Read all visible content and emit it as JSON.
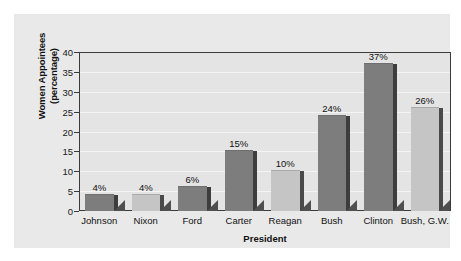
{
  "chart_data": {
    "type": "bar",
    "title": "",
    "subtitle": "",
    "xlabel": "President",
    "ylabel": "Women Appointees (percentage)",
    "ylabel_line1": "Women Appointees",
    "ylabel_line2": "(percentage)",
    "categories": [
      "Johnson",
      "Nixon",
      "Ford",
      "Carter",
      "Reagan",
      "Bush",
      "Clinton",
      "Bush, G.W."
    ],
    "values": [
      4,
      4,
      6,
      15,
      10,
      24,
      37,
      26
    ],
    "value_labels": [
      "4%",
      "4%",
      "6%",
      "15%",
      "10%",
      "24%",
      "37%",
      "26%"
    ],
    "ylim": [
      0,
      40
    ],
    "yticks": [
      0,
      5,
      10,
      15,
      20,
      25,
      30,
      35,
      40
    ],
    "ytick_labels": [
      "0",
      "5",
      "10",
      "15",
      "20",
      "25",
      "30",
      "35",
      "40"
    ],
    "grid": "horizontal",
    "legend": "none",
    "bar_shades": [
      "dark",
      "light",
      "dark",
      "dark",
      "light",
      "dark",
      "dark",
      "light"
    ],
    "colors": {
      "bar_dark": "#7d7d7d",
      "bar_light": "#c5c5c5",
      "bar_side": "#3d3d3d",
      "shadow": "#4f4f4f",
      "plot_background": "#e4e4e4",
      "panel_background": "#e9e9e9",
      "figure_background": "#ffffff",
      "axis_line": "#3b3b3b",
      "gridline": "#f4f4f4",
      "text": "#111111"
    }
  }
}
